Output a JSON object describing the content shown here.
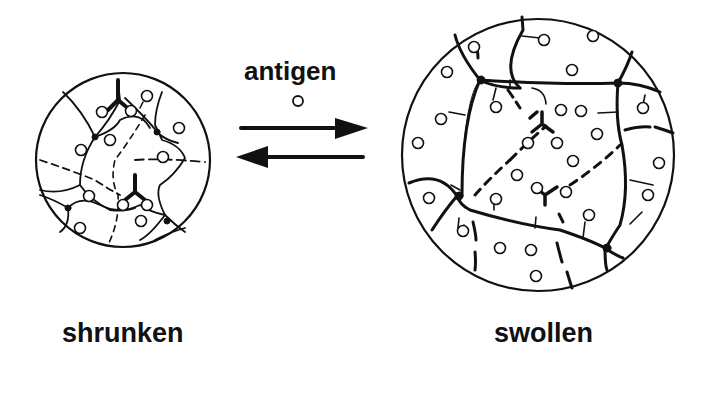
{
  "labels": {
    "antigen": "antigen",
    "shrunken": "shrunken",
    "swollen": "swollen"
  },
  "colors": {
    "ink": "#111111",
    "background": "#ffffff"
  },
  "states": [
    {
      "name": "shrunken",
      "description": "hydrogel network with antigen bound, crosslinked"
    },
    {
      "name": "swollen",
      "description": "hydrogel network expanded, antigen-antibody crosslinks released"
    }
  ],
  "transition": {
    "forward": "right-arrow",
    "reverse": "left-arrow"
  }
}
